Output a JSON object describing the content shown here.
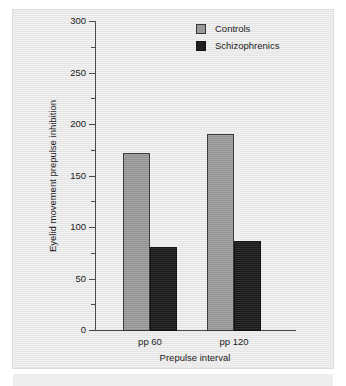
{
  "chart_data": {
    "type": "bar",
    "title": "",
    "subtitle": "",
    "xlabel": "Prepulse interval",
    "ylabel": "Eyelid movement prepulse inhibition",
    "categories": [
      "pp 60",
      "pp 120"
    ],
    "series": [
      {
        "name": "Controls",
        "color": "#9a9a9a",
        "values": [
          172,
          190
        ]
      },
      {
        "name": "Schizophrenics",
        "color": "#1f1f1f",
        "values": [
          81,
          86
        ]
      }
    ],
    "ylim": [
      0,
      300
    ],
    "yticks": [
      0,
      50,
      100,
      150,
      200,
      250,
      300
    ],
    "ytick_labels": [
      "0",
      "50",
      "100",
      "150",
      "200",
      "250",
      "300"
    ],
    "yminor_ticks": [
      25,
      75,
      125,
      175,
      225,
      275
    ],
    "grid": false,
    "legend_position": "top-right"
  },
  "legend": {
    "entries": [
      {
        "label": "Controls",
        "swatch": "controls"
      },
      {
        "label": "Schizophrenics",
        "swatch": "schizophrenics"
      }
    ]
  },
  "axes": {
    "x_title": "Prepulse interval",
    "y_title": "Eyelid movement prepulse inhibition",
    "category_labels": [
      "pp 60",
      "pp 120"
    ],
    "y_tick_labels": [
      "300",
      "250",
      "200",
      "150",
      "100",
      "50",
      "0"
    ]
  },
  "colors": {
    "panel_background": "#e9e9e9",
    "figure_background": "#ffffff",
    "axis": "#4a4a4a",
    "controls_bar": "#9a9a9a",
    "schizophrenics_bar": "#1f1f1f",
    "text": "#1b1b1b"
  }
}
